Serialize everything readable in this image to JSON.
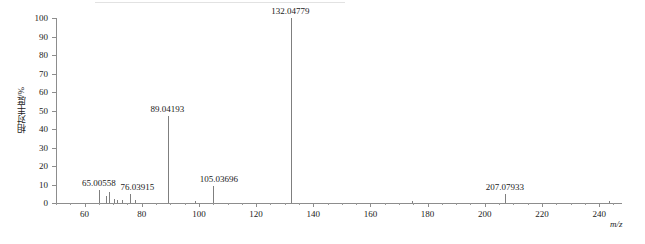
{
  "chart_data": {
    "type": "bar",
    "title": "",
    "subtitle": "",
    "xlabel": "m/z",
    "ylabel": "相对丰度/%",
    "xlim": [
      50,
      248
    ],
    "ylim": [
      0,
      100
    ],
    "grid": false,
    "legend": null,
    "x_ticks": [
      60,
      80,
      100,
      120,
      140,
      160,
      180,
      200,
      220,
      240
    ],
    "x_tick_labels": [
      "60",
      "80",
      "100",
      "120",
      "140",
      "160",
      "180",
      "200",
      "220",
      "240"
    ],
    "x_minor_tick_step": 5,
    "y_ticks": [
      0,
      10,
      20,
      30,
      40,
      50,
      60,
      70,
      80,
      90,
      100
    ],
    "y_tick_labels": [
      "0",
      "10",
      "20",
      "30",
      "40",
      "50",
      "60",
      "70",
      "80",
      "90",
      "100"
    ],
    "series": [
      {
        "name": "relative abundance",
        "peaks": [
          {
            "mz": 65.00558,
            "intensity": 7.0,
            "label": "65.00558",
            "label_x": 65.0,
            "label_y": 13.0,
            "labeled": true
          },
          {
            "mz": 67.6,
            "intensity": 4.0,
            "label": "",
            "labeled": false
          },
          {
            "mz": 68.6,
            "intensity": 6.0,
            "label": "",
            "labeled": false
          },
          {
            "mz": 70.2,
            "intensity": 2.0,
            "label": "",
            "labeled": false
          },
          {
            "mz": 71.4,
            "intensity": 1.6,
            "label": "",
            "labeled": false
          },
          {
            "mz": 73.2,
            "intensity": 1.4,
            "label": "",
            "labeled": false
          },
          {
            "mz": 76.03915,
            "intensity": 5.0,
            "label": "76.03915",
            "label_x": 78.5,
            "label_y": 11.0,
            "labeled": true
          },
          {
            "mz": 77.6,
            "intensity": 1.8,
            "label": "",
            "labeled": false
          },
          {
            "mz": 89.04193,
            "intensity": 47.0,
            "label": "89.04193",
            "label_x": 89.0,
            "label_y": 53.0,
            "labeled": true
          },
          {
            "mz": 98.5,
            "intensity": 1.2,
            "label": "",
            "labeled": false
          },
          {
            "mz": 105.03696,
            "intensity": 9.0,
            "label": "105.03696",
            "label_x": 107.0,
            "label_y": 15.0,
            "labeled": true
          },
          {
            "mz": 132.04779,
            "intensity": 100.0,
            "label": "132.04779",
            "label_x": 132.0,
            "label_y": 106.0,
            "labeled": true
          },
          {
            "mz": 174.5,
            "intensity": 1.2,
            "label": "",
            "labeled": false
          },
          {
            "mz": 207.07933,
            "intensity": 5.0,
            "label": "207.07933",
            "label_x": 207.0,
            "label_y": 11.0,
            "labeled": true
          },
          {
            "mz": 243.5,
            "intensity": 1.0,
            "label": "",
            "labeled": false
          }
        ]
      }
    ],
    "colors": {
      "peak": "#7f7f7f",
      "axis": "#8d8d8d",
      "text": "#1a1a1a",
      "background": "#ffffff"
    }
  }
}
